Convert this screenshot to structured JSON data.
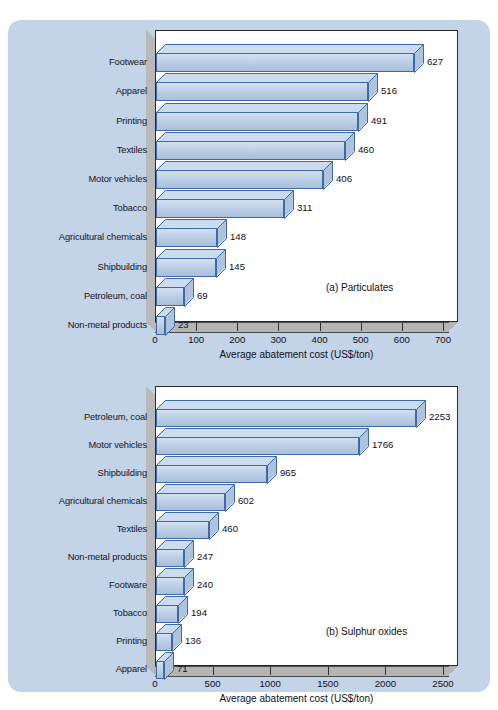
{
  "figure": {
    "background_color": "#ffffff",
    "panel_color": "#c3d3e8",
    "bar_fill_color": "#c2d3e9",
    "bar_edge_color": "#4169a8",
    "plot_background": "#ffffff",
    "floor_color": "#b5b5b5"
  },
  "chart_data": [
    {
      "type": "bar",
      "orientation": "horizontal",
      "id": "a",
      "title": "(a) Particulates",
      "xlabel": "Average abatement cost (US$/ton)",
      "ylabel": "",
      "xlim": [
        0,
        700
      ],
      "xticks": [
        0,
        100,
        200,
        300,
        400,
        500,
        600,
        700
      ],
      "xtick_labels": [
        "0",
        "100",
        "200",
        "300",
        "400",
        "500",
        "600",
        "700"
      ],
      "grid": false,
      "legend": "none",
      "categories": [
        "Footwear",
        "Apparel",
        "Printing",
        "Textiles",
        "Motor vehicles",
        "Tobacco",
        "Agricultural chemicals",
        "Shipbuilding",
        "Petroleum, coal",
        "Non-metal products"
      ],
      "values": [
        627,
        516,
        491,
        460,
        406,
        311,
        148,
        145,
        69,
        23
      ],
      "value_labels": [
        "627",
        "516",
        "491",
        "460",
        "406",
        "311",
        "148",
        "145",
        "69",
        "23"
      ]
    },
    {
      "type": "bar",
      "orientation": "horizontal",
      "id": "b",
      "title": "(b) Sulphur oxides",
      "xlabel": "Average abatement cost (US$/ton)",
      "ylabel": "",
      "xlim": [
        0,
        2500
      ],
      "xticks": [
        0,
        500,
        1000,
        1500,
        2000,
        2500
      ],
      "xtick_labels": [
        "0",
        "500",
        "1000",
        "1500",
        "2000",
        "2500"
      ],
      "grid": false,
      "legend": "none",
      "categories": [
        "Petroleum, coal",
        "Motor vehicles",
        "Shipbuilding",
        "Agricultural chemicals",
        "Textiles",
        "Non-metal products",
        "Footware",
        "Tobacco",
        "Printing",
        "Apparel"
      ],
      "values": [
        2253,
        1766,
        965,
        602,
        460,
        247,
        240,
        194,
        136,
        71
      ],
      "value_labels": [
        "2253",
        "1766",
        "965",
        "602",
        "460",
        "247",
        "240",
        "194",
        "136",
        "71"
      ]
    }
  ]
}
